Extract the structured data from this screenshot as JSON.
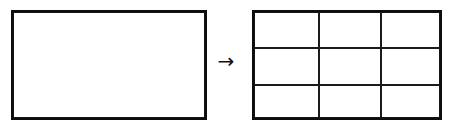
{
  "figure": {
    "background_color": "#ffffff",
    "ink_color": "#0d0d0d",
    "grid_line_color": "#1b1b1b",
    "width_px": 452,
    "height_px": 134
  },
  "source_shape": {
    "name": "plain-rectangle",
    "label": "",
    "x": 11,
    "y": 10,
    "width": 196,
    "height": 110,
    "border_width_px": 3,
    "fill": "#ffffff"
  },
  "transform": {
    "name": "arrow",
    "glyph": "→",
    "icon_name": "arrow-right-icon",
    "label": "",
    "x": 213,
    "y": 48
  },
  "result_shape": {
    "name": "grid-rectangle",
    "label": "",
    "x": 252,
    "y": 10,
    "width": 190,
    "height": 110,
    "border_width_px": 3,
    "fill": "#ffffff",
    "columns": 3,
    "rows": 3,
    "column_divider_offsets_px": [
      65,
      127
    ],
    "row_divider_offsets_px": [
      36,
      73
    ],
    "cells": [
      {
        "row": 1,
        "col": 1,
        "text": ""
      },
      {
        "row": 1,
        "col": 2,
        "text": ""
      },
      {
        "row": 1,
        "col": 3,
        "text": ""
      },
      {
        "row": 2,
        "col": 1,
        "text": ""
      },
      {
        "row": 2,
        "col": 2,
        "text": ""
      },
      {
        "row": 2,
        "col": 3,
        "text": ""
      },
      {
        "row": 3,
        "col": 1,
        "text": ""
      },
      {
        "row": 3,
        "col": 2,
        "text": ""
      },
      {
        "row": 3,
        "col": 3,
        "text": ""
      }
    ]
  }
}
